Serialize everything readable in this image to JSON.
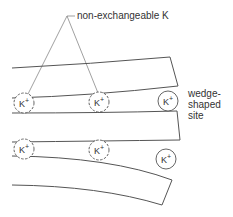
{
  "diagram": {
    "labels": {
      "top": "non-exchangeable K",
      "site_line1": "wedge-",
      "site_line2": "shaped",
      "site_line3": "site"
    },
    "ion_symbol": "K",
    "ion_charge": "+",
    "ions": [
      {
        "id": "ion-1",
        "x": 24,
        "y": 103,
        "style": "dashed",
        "type": "non-exchangeable"
      },
      {
        "id": "ion-2",
        "x": 99,
        "y": 102,
        "style": "dashed",
        "type": "non-exchangeable"
      },
      {
        "id": "ion-3",
        "x": 168,
        "y": 101,
        "style": "solid",
        "type": "wedge-site"
      },
      {
        "id": "ion-4",
        "x": 24,
        "y": 149,
        "style": "dashed",
        "type": "interlayer"
      },
      {
        "id": "ion-5",
        "x": 99,
        "y": 150,
        "style": "dashed",
        "type": "interlayer"
      },
      {
        "id": "ion-6",
        "x": 166,
        "y": 159,
        "style": "solid",
        "type": "wedge-site"
      }
    ],
    "colors": {
      "line": "#555555",
      "text": "#333333"
    }
  }
}
